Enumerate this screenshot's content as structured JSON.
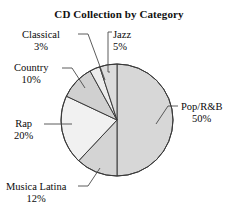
{
  "chart_data": {
    "type": "pie",
    "title": "CD Collection by Category",
    "xlabel": "",
    "ylabel": "",
    "legend": "none (direct labels with leader lines)",
    "grid": false,
    "start_angle_deg": 90,
    "direction": "clockwise",
    "categories": [
      "Pop/R&B",
      "Musica Latina",
      "Rap",
      "Country",
      "Classical",
      "Jazz"
    ],
    "values": [
      50,
      12,
      20,
      10,
      3,
      5
    ],
    "unit": "%",
    "slices": [
      {
        "label": "Pop/R&B",
        "value": 50,
        "pct_text": "50%",
        "color": "#d7d7d7"
      },
      {
        "label": "Musica Latina",
        "value": 12,
        "pct_text": "12%",
        "color": "#d4d4d4"
      },
      {
        "label": "Rap",
        "value": 20,
        "pct_text": "20%",
        "color": "#f1f1f1"
      },
      {
        "label": "Country",
        "value": 10,
        "pct_text": "10%",
        "color": "#d0d0d0"
      },
      {
        "label": "Classical",
        "value": 3,
        "pct_text": "3%",
        "color": "#ececec"
      },
      {
        "label": "Jazz",
        "value": 5,
        "pct_text": "5%",
        "color": "#dcdcdc"
      }
    ]
  },
  "labels": {
    "classical": {
      "name": "Classical",
      "pct": "3%"
    },
    "jazz": {
      "name": "Jazz",
      "pct": "5%"
    },
    "country": {
      "name": "Country",
      "pct": "10%"
    },
    "rap": {
      "name": "Rap",
      "pct": "20%"
    },
    "musica_latina": {
      "name": "Musica Latina",
      "pct": "12%"
    },
    "pop_rnb": {
      "name": "Pop/R&B",
      "pct": "50%"
    }
  },
  "colors": {
    "outline": "#3a3a3a",
    "text": "#0b0b0b",
    "background": "#ffffff"
  }
}
